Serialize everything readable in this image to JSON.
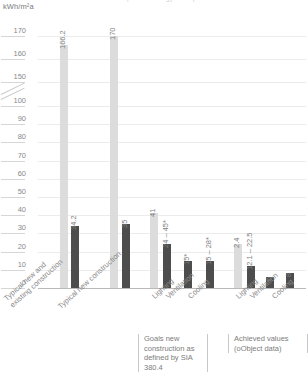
{
  "title": "Goals to limit consumption of energy - comparison",
  "axis_unit": "kWh/m²a",
  "notes": [
    {
      "id": "goals",
      "text": "Goals new construction as defined by SIA 380.4"
    },
    {
      "id": "achieved",
      "text": "Achieved values (oObject data)"
    }
  ],
  "chart_data": {
    "type": "bar",
    "title": "Goals to limit consumption of energy - comparison",
    "xlabel": "",
    "ylabel": "kWh/m²a",
    "ylim": [
      0,
      170
    ],
    "y_ticks": [
      "0",
      "10",
      "20",
      "30",
      "40",
      "50",
      "60",
      "70",
      "80",
      "90",
      "100",
      "150",
      "160",
      "170"
    ],
    "y_axis_break": {
      "between": [
        100,
        150
      ],
      "symbol": "//"
    },
    "grid": true,
    "legend": "none",
    "colors": {
      "light_bar": "#dcdcdc",
      "dark_bar": "#4d4d4d",
      "grid": "#ececec",
      "axis": "#b9b9b9"
    },
    "groups": [
      {
        "group_label": "Typical new and existing construction",
        "annotation": "",
        "bars": [
          {
            "category": "",
            "shade": "light",
            "value": 166.2,
            "label": "166.2"
          },
          {
            "category": "",
            "shade": "dark",
            "value": 34.2,
            "label": "34.2"
          }
        ]
      },
      {
        "group_label": "Typical new construction",
        "annotation": "",
        "bars": [
          {
            "category": "",
            "shade": "light",
            "value": 170,
            "label": "170"
          },
          {
            "category": "",
            "shade": "dark",
            "value": 35,
            "label": "35"
          }
        ]
      },
      {
        "group_label": "Goals new construction as defined by SIA 380.4",
        "annotation": "goals",
        "bars": [
          {
            "category": "Lighting",
            "shade": "light",
            "value": 41,
            "label": "41"
          },
          {
            "category": "Lighting",
            "shade": "dark",
            "value": 24,
            "label": "24 – 45*"
          },
          {
            "category": "Ventilation",
            "shade": "dark",
            "value": 15,
            "label": "15*"
          },
          {
            "category": "Cooling",
            "shade": "dark",
            "value": 15,
            "label": "15 – 28*"
          }
        ]
      },
      {
        "group_label": "Achieved values (oObject data)",
        "annotation": "achieved",
        "bars": [
          {
            "category": "Lighting",
            "shade": "light",
            "value": 24,
            "label": "2.4"
          },
          {
            "category": "Lighting",
            "shade": "dark",
            "value": 12.1,
            "label": "12.1 – 22.5"
          },
          {
            "category": "Ventilation",
            "shade": "dark",
            "value": 6,
            "label": "6"
          },
          {
            "category": "Cooling",
            "shade": "dark",
            "value": 8,
            "label": "8"
          }
        ]
      }
    ],
    "category_labels": [
      "Typical new and existing construction",
      "Typical new construction",
      "Lighting",
      "Ventilation",
      "Cooling",
      "Lighting",
      "Ventilation",
      "Cooling"
    ]
  }
}
